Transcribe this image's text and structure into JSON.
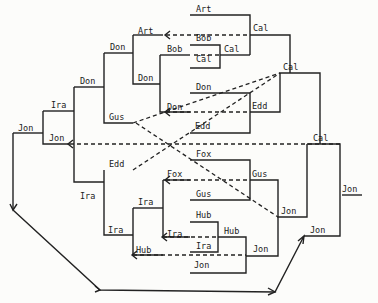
{
  "diagram": {
    "type": "tournament-bracket",
    "labels": [
      {
        "id": "art-top",
        "text": "Art",
        "x": 196,
        "y": 12
      },
      {
        "id": "art-left",
        "text": "Art",
        "x": 138,
        "y": 34
      },
      {
        "id": "bob-a",
        "text": "Bob",
        "x": 196,
        "y": 41
      },
      {
        "id": "bob-b",
        "text": "Bob",
        "x": 167,
        "y": 52
      },
      {
        "id": "cal-a",
        "text": "Cal",
        "x": 196,
        "y": 62
      },
      {
        "id": "cal-b",
        "text": "Cal",
        "x": 224,
        "y": 52
      },
      {
        "id": "cal-c",
        "text": "Cal",
        "x": 253,
        "y": 31
      },
      {
        "id": "don-a",
        "text": "Don",
        "x": 110,
        "y": 50
      },
      {
        "id": "don-b",
        "text": "Don",
        "x": 138,
        "y": 81
      },
      {
        "id": "don-c",
        "text": "Don",
        "x": 196,
        "y": 90
      },
      {
        "id": "don-d",
        "text": "Don",
        "x": 80,
        "y": 84
      },
      {
        "id": "don-e",
        "text": "Don",
        "x": 167,
        "y": 110
      },
      {
        "id": "edd-a",
        "text": "Edd",
        "x": 252,
        "y": 109
      },
      {
        "id": "edd-b",
        "text": "Edd",
        "x": 195,
        "y": 129
      },
      {
        "id": "cal-d",
        "text": "Cal",
        "x": 283,
        "y": 70
      },
      {
        "id": "ira-a",
        "text": "Ira",
        "x": 51,
        "y": 108
      },
      {
        "id": "gus-a",
        "text": "Gus",
        "x": 109,
        "y": 120
      },
      {
        "id": "jon-a",
        "text": "Jon",
        "x": 18,
        "y": 131
      },
      {
        "id": "jon-b",
        "text": "Jon",
        "x": 49,
        "y": 141
      },
      {
        "id": "cal-e",
        "text": "Cal",
        "x": 313,
        "y": 141
      },
      {
        "id": "edd-c",
        "text": "Edd",
        "x": 109,
        "y": 167
      },
      {
        "id": "fox-a",
        "text": "Fox",
        "x": 196,
        "y": 157
      },
      {
        "id": "fox-b",
        "text": "Fox",
        "x": 167,
        "y": 177
      },
      {
        "id": "gus-b",
        "text": "Gus",
        "x": 252,
        "y": 177
      },
      {
        "id": "gus-c",
        "text": "Gus",
        "x": 196,
        "y": 197
      },
      {
        "id": "jon-c",
        "text": "Jon",
        "x": 342,
        "y": 192
      },
      {
        "id": "ira-b",
        "text": "Ira",
        "x": 80,
        "y": 199
      },
      {
        "id": "ira-c",
        "text": "Ira",
        "x": 138,
        "y": 205
      },
      {
        "id": "jon-d",
        "text": "Jon",
        "x": 281,
        "y": 214
      },
      {
        "id": "hub-a",
        "text": "Hub",
        "x": 196,
        "y": 218
      },
      {
        "id": "hub-b",
        "text": "Hub",
        "x": 224,
        "y": 234
      },
      {
        "id": "ira-d",
        "text": "Ira",
        "x": 167,
        "y": 237
      },
      {
        "id": "ira-e",
        "text": "Ira",
        "x": 108,
        "y": 233
      },
      {
        "id": "ira-f",
        "text": "Ira",
        "x": 196,
        "y": 249
      },
      {
        "id": "hub-c",
        "text": "Hub",
        "x": 136,
        "y": 253
      },
      {
        "id": "jon-e",
        "text": "Jon",
        "x": 253,
        "y": 252
      },
      {
        "id": "jon-f",
        "text": "Jon",
        "x": 310,
        "y": 233
      },
      {
        "id": "jon-g",
        "text": "Jon",
        "x": 194,
        "y": 268
      }
    ],
    "caption": ""
  }
}
